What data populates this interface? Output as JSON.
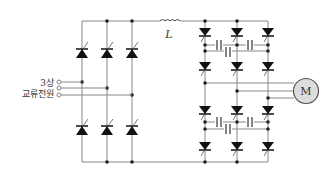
{
  "diagram": {
    "title": "",
    "input": {
      "label_line1": "3상",
      "label_line2": "교류전원",
      "terminals": 3
    },
    "inductor": {
      "label": "L"
    },
    "motor": {
      "label": "M",
      "fill": "#dddddd",
      "stroke": "#555555"
    },
    "rectifier": {
      "type": "thyristor bridge",
      "columns": 3
    },
    "inverter": {
      "type": "thyristor inverter with commutation capacitors",
      "columns": 3
    },
    "colors": {
      "wire": "#888888",
      "component": "#111111",
      "node": "#222222"
    }
  }
}
